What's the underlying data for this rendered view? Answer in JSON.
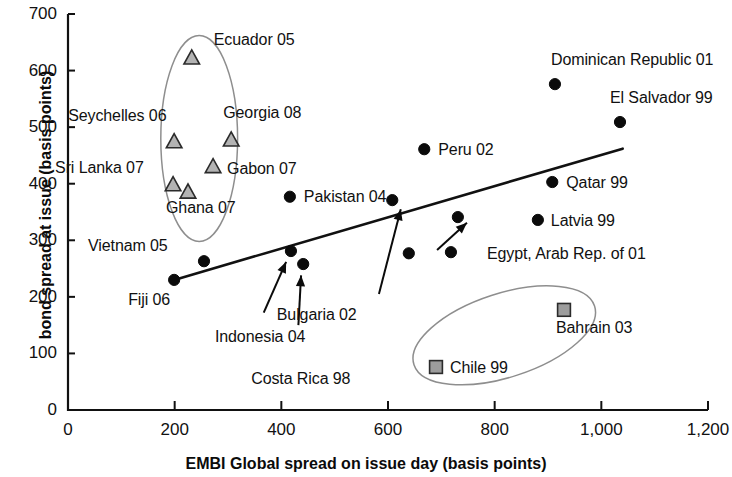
{
  "chart_data": {
    "type": "scatter",
    "title": "",
    "xlabel": "EMBI Global spread on issue day (basis points)",
    "ylabel": "bond spread at issue  (basis points)",
    "xlim": [
      0,
      1200
    ],
    "ylim": [
      0,
      700
    ],
    "xticks": [
      0,
      200,
      400,
      600,
      800,
      1000,
      1200
    ],
    "xticklabels": [
      "0",
      "200",
      "400",
      "600",
      "800",
      "1,000",
      "1,200"
    ],
    "yticks": [
      0,
      100,
      200,
      300,
      400,
      500,
      600,
      700
    ],
    "yticklabels": [
      "0",
      "100",
      "200",
      "300",
      "400",
      "500",
      "600",
      "700"
    ],
    "grid": false,
    "legend": "none",
    "series": [
      {
        "name": "triangle-markers",
        "marker": "triangle",
        "color": "#b3b3b3",
        "points": [
          {
            "label": "Ecuador 05",
            "x": 232,
            "y": 622,
            "label_dx": 22,
            "label_dy": -18
          },
          {
            "label": "Seychelles 06",
            "x": 199,
            "y": 474,
            "label_dx": -106,
            "label_dy": -26
          },
          {
            "label": "Georgia 08",
            "x": 306,
            "y": 477,
            "label_dx": -8,
            "label_dy": -27
          },
          {
            "label": "Gabon 07",
            "x": 272,
            "y": 430,
            "label_dx": 14,
            "label_dy": 2
          },
          {
            "label": "Sri Lanka 07",
            "x": 197,
            "y": 398,
            "label_dx": -118,
            "label_dy": -17
          },
          {
            "label": "Ghana 07",
            "x": 225,
            "y": 385,
            "label_dx": -22,
            "label_dy": 16
          }
        ]
      },
      {
        "name": "circle-markers",
        "marker": "circle",
        "color": "#0b0b0b",
        "points": [
          {
            "label": "Dominican Republic 01",
            "x": 913,
            "y": 576,
            "label_dx": -4,
            "label_dy": -24
          },
          {
            "label": "El Salvador 99",
            "x": 1035,
            "y": 509,
            "label_dx": -10,
            "label_dy": -24
          },
          {
            "label": "Peru 02",
            "x": 668,
            "y": 461,
            "label_dx": 14,
            "label_dy": 1
          },
          {
            "label": "Qatar 99",
            "x": 908,
            "y": 403,
            "label_dx": 14,
            "label_dy": 1
          },
          {
            "label": "Latvia 99",
            "x": 881,
            "y": 336,
            "label_dx": 13,
            "label_dy": 1
          },
          {
            "label": "Pakistan 04",
            "x": 416,
            "y": 377,
            "label_dx": 14,
            "label_dy": 0
          },
          {
            "label": "Vietnam 05",
            "x": 255,
            "y": 263,
            "label_dx": -116,
            "label_dy": -15
          },
          {
            "label": "Fiji 06",
            "x": 199,
            "y": 230,
            "label_dx": -46,
            "label_dy": 20
          },
          {
            "label": "Indonesia 04",
            "x": 418,
            "y": 281,
            "label_dx": -76,
            "label_dy": 86
          },
          {
            "label": "Costa Rica 98",
            "x": 441,
            "y": 258,
            "label_dx": -52,
            "label_dy": 115
          },
          {
            "label": "Bulgaria 02",
            "x": 639,
            "y": 277,
            "label_dx": -132,
            "label_dy": 62
          },
          {
            "label": "Egypt, Arab Rep. of 01",
            "x": 718,
            "y": 279,
            "label_dx": 36,
            "label_dy": 2
          },
          {
            "label": "",
            "x": 731,
            "y": 341,
            "label_dx": 0,
            "label_dy": 0
          },
          {
            "label": "",
            "x": 608,
            "y": 371,
            "label_dx": 0,
            "label_dy": 0
          }
        ]
      },
      {
        "name": "square-markers",
        "marker": "square",
        "color": "#9d9d9d",
        "points": [
          {
            "label": "Bahrain 03",
            "x": 930,
            "y": 177,
            "label_dx": -8,
            "label_dy": 18
          },
          {
            "label": "Chile 99",
            "x": 690,
            "y": 76,
            "label_dx": 14,
            "label_dy": 1
          }
        ]
      }
    ],
    "trend_line": {
      "x1": 199,
      "y1": 230,
      "x2": 1040,
      "y2": 462
    },
    "annotation_ellipses": [
      {
        "name": "triangle-cluster-ellipse",
        "cx": 246,
        "cy": 480,
        "rx": 72,
        "ry": 182,
        "rotate": 0
      },
      {
        "name": "square-cluster-ellipse",
        "cx": 818,
        "cy": 132,
        "rx": 178,
        "ry": 74,
        "rotate": -18
      }
    ],
    "leader_arrows": [
      {
        "name": "indonesia-leader",
        "from_x": 367,
        "from_y": 172,
        "to_x": 409,
        "to_y": 262
      },
      {
        "name": "costa-rica-leader",
        "from_x": 432,
        "from_y": 150,
        "to_x": 437,
        "to_y": 238
      },
      {
        "name": "bulgaria-leader",
        "from_x": 583,
        "from_y": 205,
        "to_x": 624,
        "to_y": 355
      },
      {
        "name": "egypt-leader",
        "from_x": 692,
        "from_y": 283,
        "to_x": 748,
        "to_y": 331
      }
    ]
  },
  "axis": {
    "x_title": "EMBI Global spread on issue day (basis points)",
    "y_title": "bond spread at issue  (basis points)"
  }
}
